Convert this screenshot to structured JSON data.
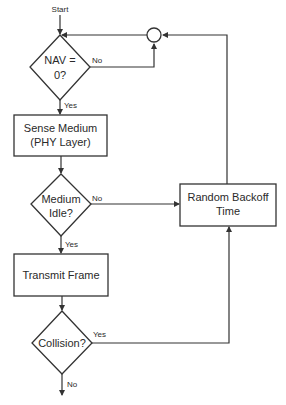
{
  "diagram": {
    "start_label": "Start",
    "nodes": {
      "nav_check": {
        "line1": "NAV =",
        "line2": "0?"
      },
      "sense_medium": {
        "line1": "Sense Medium",
        "line2": "(PHY Layer)"
      },
      "medium_idle": {
        "line1": "Medium",
        "line2": "Idle?"
      },
      "transmit_frame": {
        "line1": "Transmit Frame"
      },
      "collision": {
        "line1": "Collision?"
      },
      "random_backoff": {
        "line1": "Random Backoff",
        "line2": "Time"
      }
    },
    "edge_labels": {
      "nav_no": "No",
      "nav_yes": "Yes",
      "idle_no": "No",
      "idle_yes": "Yes",
      "collision_yes": "Yes",
      "collision_no": "No"
    }
  },
  "colors": {
    "stroke": "#333333",
    "text": "#2a2a2a",
    "background": "#ffffff"
  }
}
